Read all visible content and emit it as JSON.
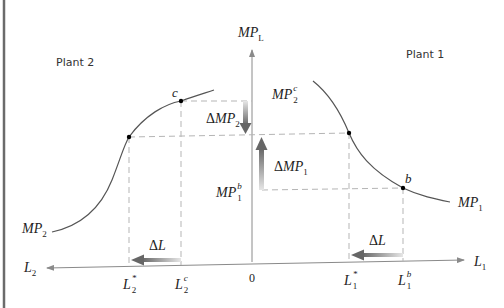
{
  "diagram": {
    "title_left_panel": "Plant 2",
    "title_right_panel": "Plant 1",
    "vertical_axis": {
      "base": "MP",
      "sub": "L"
    },
    "origin_label": "0",
    "horizontal_axis_right": {
      "base": "L",
      "sub": "1"
    },
    "horizontal_axis_left": {
      "base": "L",
      "sub": "2"
    },
    "curves": {
      "mp2": {
        "base": "MP",
        "sub": "2"
      },
      "mp1": {
        "base": "MP",
        "sub": "1"
      }
    },
    "points": {
      "c": "c",
      "b": "b"
    },
    "value_labels": {
      "mp2c": {
        "base": "MP",
        "sup": "c",
        "sub": "2"
      },
      "mp1b": {
        "base": "MP",
        "sup": "b",
        "sub": "1"
      }
    },
    "change_labels": {
      "delta_mp2": {
        "delta": "Δ",
        "base": "MP",
        "sub": "2"
      },
      "delta_mp1": {
        "delta": "Δ",
        "base": "MP",
        "sub": "1"
      },
      "delta_l_left": {
        "delta": "Δ",
        "base": "L"
      },
      "delta_l_right": {
        "delta": "Δ",
        "base": "L"
      }
    },
    "tick_labels": {
      "l2_star": {
        "base": "L",
        "sup": "*",
        "sub": "2"
      },
      "l2_c": {
        "base": "L",
        "sup": "c",
        "sub": "2"
      },
      "l1_star": {
        "base": "L",
        "sup": "*",
        "sub": "1"
      },
      "l1_b": {
        "base": "L",
        "sup": "b",
        "sub": "1"
      }
    },
    "colors": {
      "axis": "#8a8a8a",
      "curve": "#555555",
      "dashed": "#b5b5b5",
      "arrow": "#6e6e6e",
      "border": "#6b6b6b"
    }
  }
}
